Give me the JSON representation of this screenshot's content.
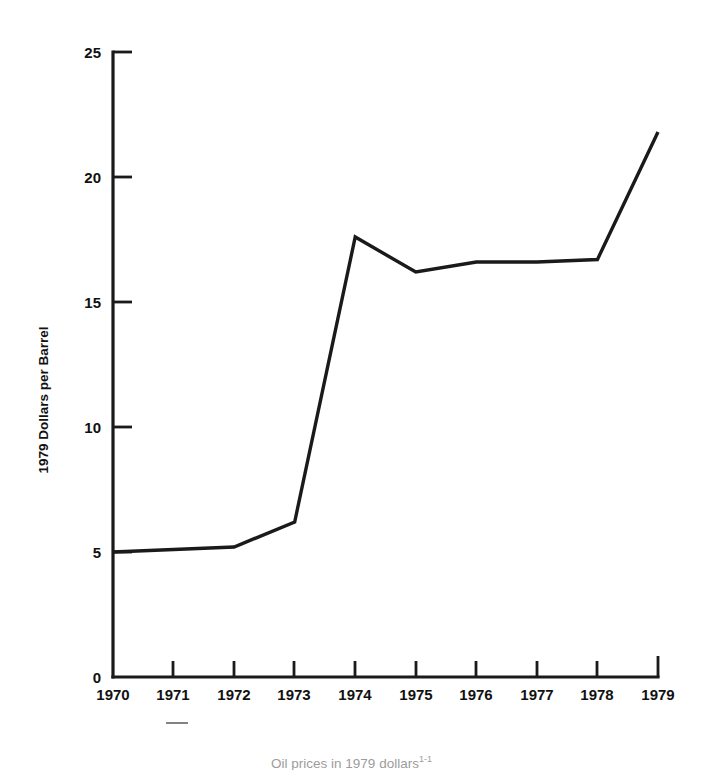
{
  "chart_data": {
    "type": "line",
    "title": "",
    "xlabel": "",
    "ylabel": "1979 Dollars per Barrel",
    "categories": [
      "1970",
      "1971",
      "1972",
      "1973",
      "1974",
      "1975",
      "1976",
      "1977",
      "1978",
      "1979"
    ],
    "x": [
      1970,
      1971,
      1972,
      1973,
      1974,
      1975,
      1976,
      1977,
      1978,
      1979
    ],
    "values": [
      5.0,
      5.1,
      5.2,
      6.2,
      17.6,
      16.2,
      16.6,
      16.6,
      16.7,
      21.8
    ],
    "series": [
      {
        "name": "Real crude oil price",
        "values": [
          5.0,
          5.1,
          5.2,
          6.2,
          17.6,
          16.2,
          16.6,
          16.6,
          16.7,
          21.8
        ]
      }
    ],
    "ylim": [
      0,
      25
    ],
    "xlim": [
      1970,
      1979
    ],
    "yticks": [
      0,
      5,
      10,
      15,
      20,
      25
    ],
    "ytick_labels": [
      "0",
      "5",
      "10",
      "15",
      "20",
      "25"
    ],
    "xticks": [
      1970,
      1971,
      1972,
      1973,
      1974,
      1975,
      1976,
      1977,
      1978,
      1979
    ],
    "xtick_labels": [
      "1970",
      "1971",
      "1972",
      "1973",
      "1974",
      "1975",
      "1976",
      "1977",
      "1978",
      "1979"
    ],
    "grid": false,
    "legend": false,
    "legend_position": "none",
    "line_color": "#1a1a1a",
    "background_color": "#ffffff",
    "annotations": []
  },
  "figure": {
    "y_axis_title": "1979 Dollars per Barrel",
    "caption": "Oil prices in 1979 dollars",
    "caption_marker": "1-1"
  }
}
